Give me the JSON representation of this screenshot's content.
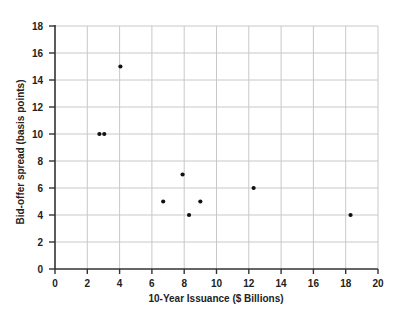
{
  "chart_data": {
    "type": "scatter",
    "title": "",
    "xlabel": "10-Year Issuance ($ Billions)",
    "ylabel": "Bid-offer spread (basis points)",
    "xlim": [
      0,
      20
    ],
    "ylim": [
      0,
      18
    ],
    "xticks": [
      0,
      2,
      4,
      6,
      8,
      10,
      12,
      14,
      16,
      18,
      20
    ],
    "yticks": [
      0,
      2,
      4,
      6,
      8,
      10,
      12,
      14,
      16,
      18
    ],
    "grid": true,
    "legend": null,
    "series": [
      {
        "name": "Issuance vs spread",
        "points": [
          {
            "x": 2.75,
            "y": 10
          },
          {
            "x": 3.05,
            "y": 10
          },
          {
            "x": 4.05,
            "y": 15
          },
          {
            "x": 6.7,
            "y": 5
          },
          {
            "x": 7.9,
            "y": 7
          },
          {
            "x": 8.3,
            "y": 4
          },
          {
            "x": 9.0,
            "y": 5
          },
          {
            "x": 12.3,
            "y": 6
          },
          {
            "x": 18.3,
            "y": 4
          }
        ]
      }
    ]
  }
}
